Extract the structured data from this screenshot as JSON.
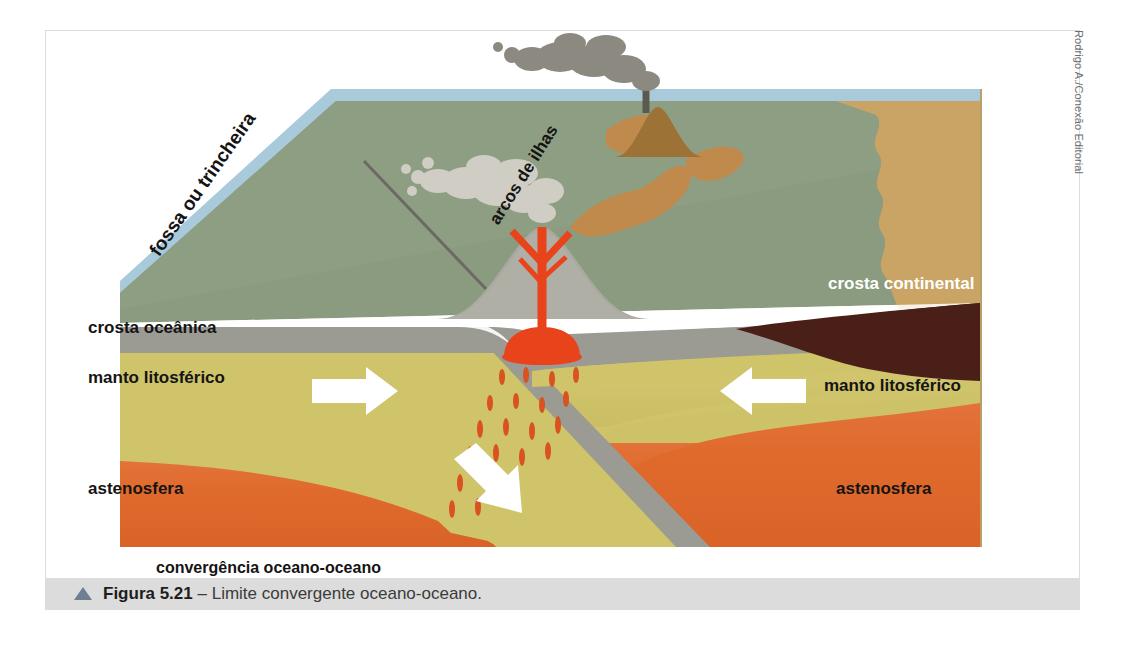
{
  "credit": "Rodrigo A./Conexão Editorial",
  "caption": {
    "marker": "triangle-up",
    "figure_number": "Figura 5.21",
    "separator": " – ",
    "text": "Limite convergente oceano-oceano."
  },
  "diagram": {
    "title": "convergência oceano-oceano",
    "labels": {
      "trench": "fossa ou trincheira",
      "island_arcs": "arcos de ilhas",
      "oceanic_crust": "crosta oceânica",
      "continental_crust": "crosta continental",
      "lithospheric_mantle_left": "manto litosférico",
      "lithospheric_mantle_right": "manto litosférico",
      "asthenosphere_left": "astenosfera",
      "asthenosphere_right": "astenosfera"
    },
    "colors": {
      "ocean_surface": "#a8cadb",
      "water_body": "#8b9b80",
      "water_body_dark": "#76876c",
      "oceanic_crust": "#9b9a93",
      "lithospheric_mantle": "#cfc469",
      "asthenosphere": "#df6c2b",
      "continental_crust": "#4a1f17",
      "landmass": "#c9a465",
      "island": "#c08a4c",
      "magma": "#e8431a",
      "smoke": "#8c8a80",
      "arrow": "#ffffff",
      "caption_bar": "#dcdcdc",
      "caption_marker": "#6f7f92",
      "frame_border": "#dcdcdc"
    },
    "motion_arrows": [
      {
        "name": "left-plate-converging",
        "direction": "right"
      },
      {
        "name": "right-plate-converging",
        "direction": "left"
      },
      {
        "name": "subducting-slab",
        "direction": "down-right"
      }
    ],
    "features": [
      "volcanic-island-eruption",
      "island-arc-volcano",
      "magma-chamber",
      "magma-droplets",
      "subduction-zone"
    ]
  }
}
